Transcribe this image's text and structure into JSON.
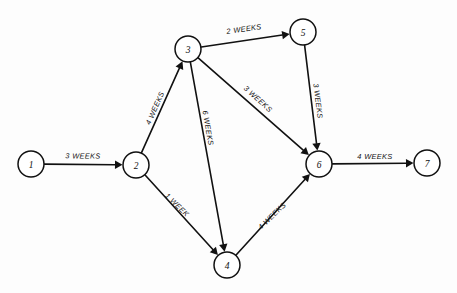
{
  "diagram": {
    "type": "activity-on-arrow network",
    "background_color": "#fdfdfd",
    "line_color": "#111111",
    "node_fill": "#ffffff",
    "node_radius": 13,
    "nodes": [
      {
        "id": "1",
        "label": "1",
        "x": 31,
        "y": 164
      },
      {
        "id": "2",
        "label": "2",
        "x": 136,
        "y": 165
      },
      {
        "id": "3",
        "label": "3",
        "x": 188,
        "y": 49
      },
      {
        "id": "4",
        "label": "4",
        "x": 227,
        "y": 265
      },
      {
        "id": "5",
        "label": "5",
        "x": 303,
        "y": 32
      },
      {
        "id": "6",
        "label": "6",
        "x": 319,
        "y": 164
      },
      {
        "id": "7",
        "label": "7",
        "x": 427,
        "y": 163
      }
    ],
    "edges": [
      {
        "id": "e1-2",
        "from": "1",
        "to": "2",
        "label": "3 WEEKS",
        "weeks": 3,
        "label_x": 83,
        "label_y": 156,
        "label_rot": 0.5
      },
      {
        "id": "e2-3",
        "from": "2",
        "to": "3",
        "label": "4 WEEKS",
        "weeks": 4,
        "label_x": 155,
        "label_y": 108,
        "label_rot": -66
      },
      {
        "id": "e2-4",
        "from": "2",
        "to": "4",
        "label": "1 WEEK",
        "weeks": 1,
        "label_x": 177,
        "label_y": 205,
        "label_rot": 44
      },
      {
        "id": "e3-5",
        "from": "3",
        "to": "5",
        "label": "2 WEEKS",
        "weeks": 2,
        "label_x": 244,
        "label_y": 29,
        "label_rot": -8
      },
      {
        "id": "e3-6",
        "from": "3",
        "to": "6",
        "label": "3 WEEKS",
        "weeks": 3,
        "label_x": 258,
        "label_y": 99,
        "label_rot": 42
      },
      {
        "id": "e3-4",
        "from": "3",
        "to": "4",
        "label": "6 WEEKS",
        "weeks": 6,
        "label_x": 208,
        "label_y": 128,
        "label_rot": 80
      },
      {
        "id": "e5-6",
        "from": "5",
        "to": "6",
        "label": "3 WEEKS",
        "weeks": 3,
        "label_x": 318,
        "label_y": 101,
        "label_rot": 83
      },
      {
        "id": "e4-6",
        "from": "4",
        "to": "6",
        "label": "4 WEEKS",
        "weeks": 4,
        "label_x": 272,
        "label_y": 216,
        "label_rot": -44
      },
      {
        "id": "e6-7",
        "from": "6",
        "to": "7",
        "label": "4 WEEKS",
        "weeks": 4,
        "label_x": 375,
        "label_y": 156,
        "label_rot": 0
      }
    ]
  }
}
